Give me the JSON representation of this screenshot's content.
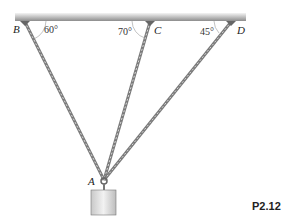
{
  "labels": {
    "B": "B",
    "C": "C",
    "D": "D",
    "A": "A"
  },
  "angles": {
    "B": "60°",
    "C": "70°",
    "D": "45°"
  },
  "figure_id": "P2.12",
  "colors": {
    "ceiling": "#9a9a9a",
    "chain": "#8a8a8a",
    "weight": "#d8d8d8"
  }
}
